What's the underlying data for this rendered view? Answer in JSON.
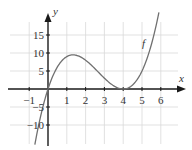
{
  "chart_data": {
    "type": "line",
    "title": "",
    "xlabel": "x",
    "ylabel": "y",
    "function_label": "f",
    "function_formula": "f(x) = x(x-4)^2",
    "xlim": [
      -1.8,
      7.0
    ],
    "ylim": [
      -15.3,
      24.7
    ],
    "grid": true,
    "x_ticks": [
      -1,
      1,
      2,
      3,
      4,
      5,
      6
    ],
    "x_tick_labels": [
      "−1",
      "1",
      "2",
      "3",
      "4",
      "5",
      "6"
    ],
    "y_ticks": [
      15,
      10,
      5,
      -5,
      -10
    ],
    "y_tick_labels": [
      "15",
      "10",
      "5",
      "−5",
      "−10"
    ],
    "series": [
      {
        "name": "f",
        "x": [
          -0.7,
          -0.5,
          0,
          0.5,
          1,
          1.333,
          2,
          2.5,
          3,
          3.5,
          4,
          4.5,
          5,
          5.5,
          5.9
        ],
        "y": [
          -15.5,
          -10.1,
          0,
          6.1,
          9,
          9.48,
          8,
          5.6,
          3,
          0.9,
          0,
          1.1,
          5,
          12.4,
          21.3
        ]
      }
    ],
    "annotations": [
      {
        "text": "f",
        "x": 5.2,
        "y": 12.5
      },
      {
        "text": "local max ≈ (1.33, 9.48)"
      },
      {
        "text": "local min at (4, 0)"
      }
    ]
  },
  "labels": {
    "x_axis": "x",
    "y_axis": "y",
    "curve": "f",
    "xt": [
      "−1",
      "1",
      "2",
      "3",
      "4",
      "5",
      "6"
    ],
    "yt": [
      "15",
      "10",
      "5",
      "−5",
      "−10"
    ]
  }
}
